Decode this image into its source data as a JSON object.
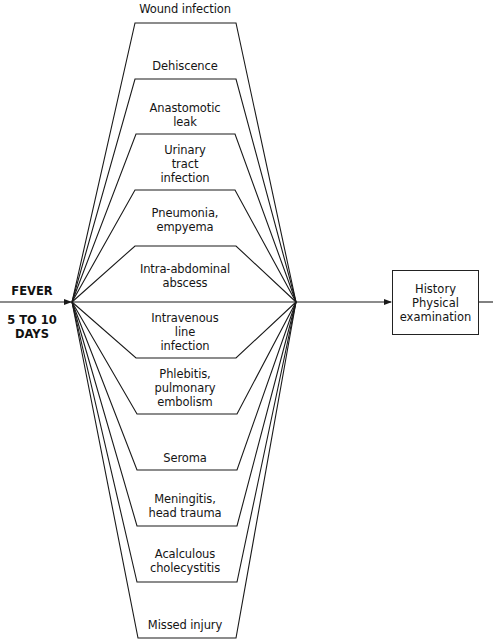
{
  "start": {
    "title": "FEVER",
    "subtitle": "5 TO 10\nDAYS"
  },
  "causes": [
    {
      "label": "Wound infection"
    },
    {
      "label": "Dehiscence"
    },
    {
      "label": "Anastomotic\nleak"
    },
    {
      "label": "Urinary\ntract\ninfection"
    },
    {
      "label": "Pneumonia,\nempyema"
    },
    {
      "label": "Intra-abdominal\nabscess"
    },
    {
      "label": "Intravenous\nline\ninfection"
    },
    {
      "label": "Phlebitis,\npulmonary\nembolism"
    },
    {
      "label": "Seroma"
    },
    {
      "label": "Meningitis,\nhead trauma"
    },
    {
      "label": "Acalculous\ncholecystitis"
    },
    {
      "label": "Missed injury"
    }
  ],
  "next_step": {
    "label": "History\nPhysical\nexamination"
  },
  "colors": {
    "line": "#1a1a1a",
    "background": "#ffffff"
  }
}
